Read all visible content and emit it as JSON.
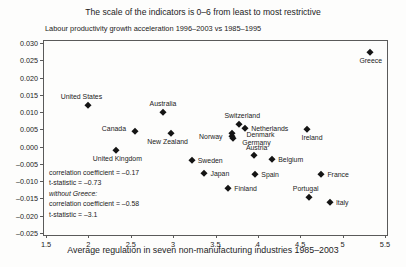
{
  "title": "The scale of the indicators is 0–6 from least to most restrictive",
  "subtitle": "Labour productivity growth acceleration 1996–2003 vs 1985–1995",
  "chart_data": {
    "type": "scatter",
    "title": "The scale of the indicators is 0–6 from least to most restrictive",
    "ylabel": "Labour productivity growth acceleration 1996–2003 vs 1985–1995",
    "xlabel": "Average regulation in seven non-manufacturing industries 1985–2003",
    "xlim": [
      1.476,
      5.524
    ],
    "ylim": [
      -0.0256,
      0.0306
    ],
    "grid": false,
    "marker": "diamond",
    "marker_color": "#141414",
    "x_ticks": [
      {
        "value": 1.5,
        "label": "1.5"
      },
      {
        "value": 2,
        "label": "2"
      },
      {
        "value": 2.5,
        "label": "2.5"
      },
      {
        "value": 3,
        "label": "3"
      },
      {
        "value": 3.5,
        "label": "3.5"
      },
      {
        "value": 4,
        "label": "4"
      },
      {
        "value": 4.5,
        "label": "4.5"
      },
      {
        "value": 5,
        "label": "5"
      },
      {
        "value": 5.5,
        "label": "5.5"
      }
    ],
    "y_ticks": [
      {
        "value": 0.03,
        "label": "0.030"
      },
      {
        "value": 0.025,
        "label": "0.025"
      },
      {
        "value": 0.02,
        "label": "0.020"
      },
      {
        "value": 0.015,
        "label": "0.015"
      },
      {
        "value": 0.01,
        "label": "0.010"
      },
      {
        "value": 0.005,
        "label": "0.005"
      },
      {
        "value": 0.0,
        "label": "0.000"
      },
      {
        "value": -0.005,
        "label": "–0.005"
      },
      {
        "value": -0.01,
        "label": "–0.010"
      },
      {
        "value": -0.015,
        "label": "–0.015"
      },
      {
        "value": -0.02,
        "label": "–0.020"
      },
      {
        "value": -0.025,
        "label": "–0.025"
      }
    ],
    "points": [
      {
        "label": "United States",
        "x": 2.0,
        "y": 0.012,
        "anchor": "above",
        "dx": -7,
        "dy": 0
      },
      {
        "label": "Canada",
        "x": 2.55,
        "y": 0.0045,
        "anchor": "left",
        "dx": -3,
        "dy": -3
      },
      {
        "label": "United Kingdom",
        "x": 2.33,
        "y": -0.001,
        "anchor": "below",
        "dx": 1,
        "dy": 0
      },
      {
        "label": "Australia",
        "x": 2.88,
        "y": 0.01,
        "anchor": "above",
        "dx": 0,
        "dy": 0
      },
      {
        "label": "New Zealand",
        "x": 2.97,
        "y": 0.004,
        "anchor": "below",
        "dx": -3,
        "dy": 0
      },
      {
        "label": "Sweden",
        "x": 3.22,
        "y": -0.004,
        "anchor": "right",
        "dx": 0,
        "dy": 0
      },
      {
        "label": "Japan",
        "x": 3.37,
        "y": -0.0075,
        "anchor": "right",
        "dx": 0,
        "dy": 0
      },
      {
        "label": "Finland",
        "x": 3.65,
        "y": -0.012,
        "anchor": "right",
        "dx": 0,
        "dy": 0
      },
      {
        "label": "Norway",
        "x": 3.7,
        "y": 0.0032,
        "anchor": "left",
        "dx": -4,
        "dy": 0
      },
      {
        "label": "Denmark",
        "x": 3.7,
        "y": 0.004,
        "anchor": "right",
        "dx": 8,
        "dy": 1
      },
      {
        "label": "Germany",
        "x": 3.71,
        "y": 0.0024,
        "anchor": "right",
        "dx": 3,
        "dy": 4
      },
      {
        "label": "Switzerland",
        "x": 3.78,
        "y": 0.0065,
        "anchor": "above",
        "dx": 3,
        "dy": 0
      },
      {
        "label": "Netherlands",
        "x": 3.85,
        "y": 0.0055,
        "anchor": "right",
        "dx": 0,
        "dy": 0
      },
      {
        "label": "Austria",
        "x": 3.95,
        "y": -0.0025,
        "anchor": "above",
        "dx": 3,
        "dy": 1
      },
      {
        "label": "Spain",
        "x": 3.97,
        "y": -0.008,
        "anchor": "right",
        "dx": 0,
        "dy": 0
      },
      {
        "label": "Belgium",
        "x": 4.17,
        "y": -0.0035,
        "anchor": "right",
        "dx": 0,
        "dy": 0
      },
      {
        "label": "Ireland",
        "x": 4.58,
        "y": 0.005,
        "anchor": "below",
        "dx": 5,
        "dy": 0
      },
      {
        "label": "France",
        "x": 4.75,
        "y": -0.008,
        "anchor": "right",
        "dx": 0,
        "dy": 0
      },
      {
        "label": "Portugal",
        "x": 4.6,
        "y": -0.0145,
        "anchor": "above",
        "dx": -3,
        "dy": 0
      },
      {
        "label": "Italy",
        "x": 4.85,
        "y": -0.016,
        "anchor": "right",
        "dx": 0,
        "dy": 0
      },
      {
        "label": "Greece",
        "x": 5.32,
        "y": 0.0275,
        "anchor": "below",
        "dx": 1,
        "dy": 0
      }
    ],
    "annotations": [
      {
        "text": "correlation coefficient = –0.17",
        "italic": false
      },
      {
        "text": "t-statistic = –0.73",
        "italic": false
      },
      {
        "text": "without Greece:",
        "italic": true
      },
      {
        "text": "correlation coefficient = –0.58",
        "italic": false
      },
      {
        "text": "t-statistic = –3.1",
        "italic": false
      }
    ]
  }
}
